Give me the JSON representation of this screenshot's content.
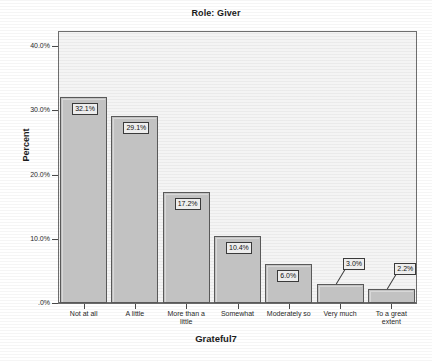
{
  "chart_data": {
    "type": "bar",
    "title": "Role: Giver",
    "xlabel": "Grateful7",
    "ylabel": "Percent",
    "categories": [
      "Not at all",
      "A little",
      "More than a little",
      "Somewhat",
      "Moderately so",
      "Very much",
      "To a great extent"
    ],
    "values": [
      32.1,
      29.1,
      17.2,
      10.4,
      6.0,
      3.0,
      2.2
    ],
    "data_labels": [
      "32.1%",
      "29.1%",
      "17.2%",
      "10.4%",
      "6.0%",
      "3.0%",
      "2.2%"
    ],
    "ylim": [
      0,
      42.5
    ],
    "ytick_values": [
      40.0,
      30.0,
      20.0,
      10.0,
      0.0
    ],
    "ytick_labels": [
      "40.0%",
      "30.0%",
      "20.0%",
      "10.0%",
      ".0%"
    ],
    "grid": false,
    "legend": "none",
    "bar_fill_color": "#c2c2c2",
    "bar_edge_color": "#595959",
    "plot_background_color": "#f4f4f4",
    "figure_background_color": "#ffffff",
    "label_box_color": "#ededed"
  }
}
